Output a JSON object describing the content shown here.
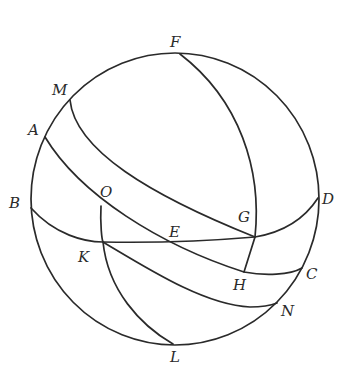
{
  "diagram": {
    "type": "spherical-geometry",
    "points": {
      "F": "F",
      "M": "M",
      "A": "A",
      "B": "B",
      "O": "O",
      "G": "G",
      "D": "D",
      "E": "E",
      "K": "K",
      "H": "H",
      "C": "C",
      "N": "N",
      "L": "L"
    },
    "arcs": [
      "sphere-outline",
      "arc-M-G",
      "arc-A-O-E-H-C",
      "arc-B-K-E-G-D",
      "arc-F-G-H",
      "arc-O-K-L",
      "arc-K-N"
    ],
    "colors": {
      "stroke": "#2a2a2a",
      "background": "#ffffff"
    }
  }
}
